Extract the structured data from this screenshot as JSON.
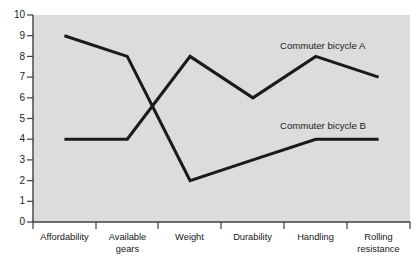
{
  "chart_data": {
    "type": "line",
    "title": "",
    "xlabel": "",
    "ylabel": "",
    "ylim": [
      0,
      10
    ],
    "ytick_step": 1,
    "yticks": [
      "10",
      "9",
      "8",
      "7",
      "6",
      "5",
      "4",
      "3",
      "2",
      "1",
      "0"
    ],
    "grid": false,
    "legend_position": "inline-right",
    "categories": [
      "Affordability",
      "Available\ngears",
      "Weight",
      "Durability",
      "Handling",
      "Rolling\nresistance"
    ],
    "series": [
      {
        "name": "Commuter bicycle A",
        "values": [
          4,
          4,
          8,
          6,
          8,
          7
        ],
        "color": "#1a1a1a"
      },
      {
        "name": "Commuter bicycle B",
        "values": [
          9,
          8,
          2,
          3,
          4,
          4
        ],
        "color": "#1a1a1a"
      }
    ],
    "plot_background": "#dcdcdc",
    "axis_color": "#3f3f3f"
  },
  "axis": {
    "y_labels": [
      "10",
      "9",
      "8",
      "7",
      "6",
      "5",
      "4",
      "3",
      "2",
      "1",
      "0"
    ],
    "x_labels": [
      {
        "line1": "Affordability",
        "line2": ""
      },
      {
        "line1": "Available",
        "line2": "gears"
      },
      {
        "line1": "Weight",
        "line2": ""
      },
      {
        "line1": "Durability",
        "line2": ""
      },
      {
        "line1": "Handling",
        "line2": ""
      },
      {
        "line1": "Rolling",
        "line2": "resistance"
      }
    ]
  },
  "labels": {
    "series_a": "Commuter bicycle A",
    "series_b": "Commuter bicycle B"
  }
}
